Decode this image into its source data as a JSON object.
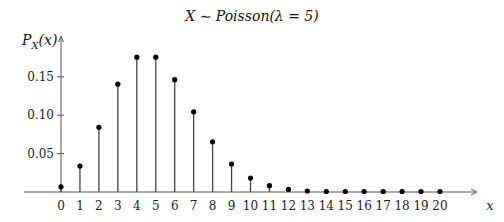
{
  "chart_data": {
    "type": "stem",
    "xlabel": "x",
    "ylabel": "P_X(x)",
    "x": [
      0,
      1,
      2,
      3,
      4,
      5,
      6,
      7,
      8,
      9,
      10,
      11,
      12,
      13,
      14,
      15,
      16,
      17,
      18,
      19,
      20
    ],
    "values": [
      0.0067,
      0.0337,
      0.0842,
      0.1404,
      0.1755,
      0.1755,
      0.1462,
      0.1044,
      0.0653,
      0.0363,
      0.0181,
      0.0082,
      0.0034,
      0.0013,
      0.0005,
      0.0002,
      0.0,
      0.0,
      0.0,
      0.0,
      0.0
    ],
    "yticks": [
      "0.05",
      "0.10",
      "0.15"
    ],
    "ytick_values": [
      0.05,
      0.1,
      0.15
    ],
    "xlim": [
      0,
      20
    ],
    "ylim": [
      0,
      0.18
    ],
    "grid": false,
    "legend": null
  },
  "title_main": "X ∼ Poisson(λ = 5)",
  "ylabel_main": "P",
  "ylabel_sub": "X",
  "ylabel_tail": "(x)",
  "xlabel_main": "x"
}
